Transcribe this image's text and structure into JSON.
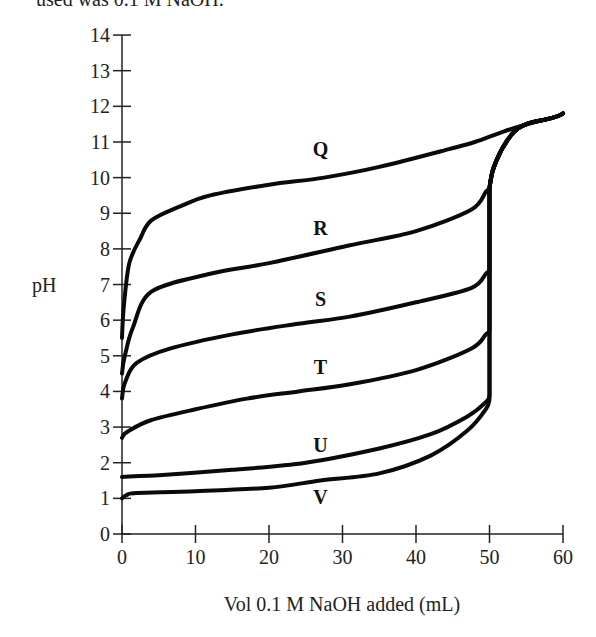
{
  "header": {
    "caption_fragment": "used was 0.1 M NaOH."
  },
  "chart_data": {
    "type": "line",
    "title": "",
    "xlabel": "Vol 0.1 M NaOH added (mL)",
    "ylabel": "pH",
    "xlim": [
      0,
      60
    ],
    "ylim": [
      0,
      14
    ],
    "grid": false,
    "legend_position": "inline labels above/below curves",
    "x_ticks": [
      0,
      10,
      20,
      30,
      40,
      50,
      60
    ],
    "y_ticks": [
      0,
      1,
      2,
      3,
      4,
      5,
      6,
      7,
      8,
      9,
      10,
      11,
      12,
      13,
      14
    ],
    "equivalence_point_ml": 50,
    "series": [
      {
        "name": "Q",
        "label_pos": [
          27,
          10.6
        ],
        "x": [
          0,
          0.3,
          1,
          2.5,
          4,
          8,
          12,
          20,
          27.5,
          35,
          44.5,
          48,
          52,
          56,
          60
        ],
        "y": [
          5.5,
          6.5,
          7.6,
          8.3,
          8.8,
          9.2,
          9.5,
          9.8,
          10.0,
          10.3,
          10.8,
          11.0,
          11.3,
          11.55,
          11.8
        ]
      },
      {
        "name": "R",
        "label_pos": [
          27,
          8.4
        ],
        "x": [
          0,
          0.5,
          1.5,
          4,
          12,
          20,
          31,
          40,
          47.5,
          49.5,
          50,
          50,
          51,
          53,
          55,
          60
        ],
        "y": [
          4.5,
          5.1,
          5.8,
          6.8,
          7.3,
          7.6,
          8.1,
          8.5,
          9.1,
          9.6,
          9.7,
          9.7,
          10.5,
          11.2,
          11.5,
          11.8
        ]
      },
      {
        "name": "S",
        "label_pos": [
          27,
          6.4
        ],
        "x": [
          0,
          0.5,
          2,
          6.5,
          15,
          24,
          31,
          40,
          47.5,
          49.5,
          50,
          50,
          51,
          53,
          55,
          60
        ],
        "y": [
          3.8,
          4.3,
          4.8,
          5.2,
          5.6,
          5.9,
          6.1,
          6.5,
          6.9,
          7.3,
          7.4,
          9.7,
          10.5,
          11.2,
          11.5,
          11.8
        ]
      },
      {
        "name": "T",
        "label_pos": [
          27,
          4.5
        ],
        "x": [
          0,
          1,
          4,
          10,
          17,
          24,
          31,
          40,
          47.5,
          49.5,
          50,
          50,
          51,
          53,
          55,
          60
        ],
        "y": [
          2.7,
          2.9,
          3.2,
          3.5,
          3.8,
          4.0,
          4.2,
          4.6,
          5.2,
          5.6,
          5.7,
          9.7,
          10.5,
          11.2,
          11.5,
          11.8
        ]
      },
      {
        "name": "U",
        "label_pos": [
          27,
          2.3
        ],
        "x": [
          0,
          5,
          15,
          25,
          35,
          42,
          47,
          49.5,
          50,
          50,
          51,
          53,
          55,
          60
        ],
        "y": [
          1.6,
          1.65,
          1.8,
          2.0,
          2.4,
          2.8,
          3.3,
          3.7,
          3.9,
          9.7,
          10.5,
          11.2,
          11.5,
          11.8
        ]
      },
      {
        "name": "V",
        "label_pos": [
          27,
          0.85
        ],
        "x": [
          0,
          0.7,
          2,
          10,
          20,
          27,
          35,
          42,
          47,
          49.5,
          50,
          50,
          51,
          53,
          55,
          60
        ],
        "y": [
          1.0,
          1.1,
          1.15,
          1.2,
          1.3,
          1.5,
          1.7,
          2.2,
          2.9,
          3.5,
          3.8,
          9.7,
          10.5,
          11.2,
          11.5,
          11.8
        ]
      }
    ]
  }
}
